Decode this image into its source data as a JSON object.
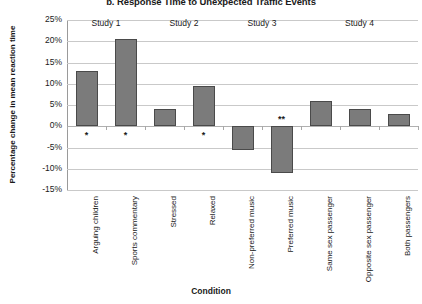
{
  "chart_data": {
    "type": "bar",
    "title": "b. Response Time to Unexpected Traffic Events",
    "xlabel": "Condition",
    "ylabel": "Percentage change in mean reaction time",
    "ylim": [
      -15,
      25
    ],
    "ytick_labels": [
      "25%",
      "20%",
      "15%",
      "10%",
      "5%",
      "0%",
      "-5%",
      "-10%",
      "-15%"
    ],
    "ytick_values": [
      25,
      20,
      15,
      10,
      5,
      0,
      -5,
      -10,
      -15
    ],
    "grid": true,
    "legend": "none",
    "categories": [
      "Arguing children",
      "Sports commentary",
      "Stressed",
      "Relaxed",
      "Non-preferred music",
      "Preferred music",
      "Same sex passenger",
      "Opposite sex passenger",
      "Both passengers"
    ],
    "values": [
      13,
      20.5,
      4,
      9.5,
      -5.5,
      -11,
      6,
      4,
      3
    ],
    "annotations": [
      "*",
      "*",
      "",
      "*",
      "",
      "**",
      "",
      "",
      ""
    ],
    "groups": [
      {
        "label": "Study 1",
        "categories": [
          "Arguing children",
          "Sports commentary"
        ]
      },
      {
        "label": "Study 2",
        "categories": [
          "Stressed",
          "Relaxed"
        ]
      },
      {
        "label": "Study 3",
        "categories": [
          "Non-preferred music",
          "Preferred music"
        ]
      },
      {
        "label": "Study 4",
        "categories": [
          "Same sex passenger",
          "Opposite sex passenger",
          "Both passengers"
        ]
      }
    ],
    "bar_color": "#7b7b7b",
    "bar_border_color": "#4a4a4a",
    "gridline_color": "#c9c9c9"
  }
}
